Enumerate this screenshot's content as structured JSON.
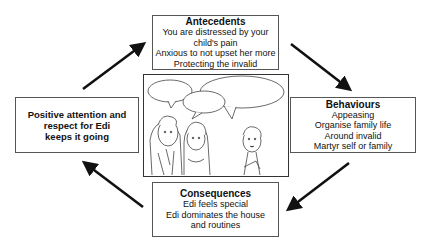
{
  "diagram": {
    "type": "cycle",
    "nodes": {
      "antecedents": {
        "title": "Antecedents",
        "lines": [
          "You are distressed by your",
          "child's pain",
          "Anxious to not upset her more",
          "Protecting the invalid"
        ]
      },
      "behaviours": {
        "title": "Behaviours",
        "lines": [
          "Appeasing",
          "Organise family life",
          "Around invalid",
          "Martyr self or family"
        ]
      },
      "consequences": {
        "title": "Consequences",
        "lines": [
          "Edi feels special",
          "Edi dominates the house",
          "and routines"
        ]
      },
      "maintenance": {
        "lines": [
          "Positive attention and",
          "respect for Edi",
          "keeps it going"
        ]
      }
    },
    "center_image": {
      "description": "cartoon illustration of three people (two adults, one child) with empty speech bubbles"
    },
    "edges": [
      {
        "from": "antecedents",
        "to": "behaviours"
      },
      {
        "from": "behaviours",
        "to": "consequences"
      },
      {
        "from": "consequences",
        "to": "maintenance"
      },
      {
        "from": "maintenance",
        "to": "antecedents"
      }
    ],
    "colors": {
      "arrow": "#111111",
      "border": "#555555",
      "text": "#111111"
    }
  }
}
